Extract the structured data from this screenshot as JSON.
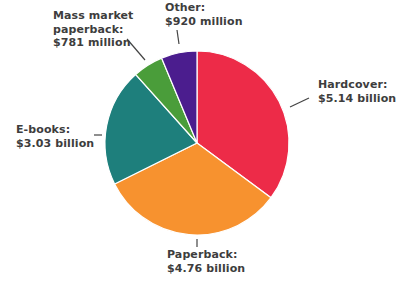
{
  "chart_data": {
    "type": "pie",
    "title": "",
    "center": [
      197,
      143
    ],
    "radius": 92,
    "start_angle_deg": 0,
    "direction": "clockwise",
    "slices": [
      {
        "name": "Hardcover",
        "value": 5.14,
        "display": "$5.14 billion",
        "color": "#ED2B48"
      },
      {
        "name": "Paperback",
        "value": 4.76,
        "display": "$4.76 billion",
        "color": "#F7922F"
      },
      {
        "name": "E-books",
        "value": 3.03,
        "display": "$3.03 billion",
        "color": "#1E7F7C"
      },
      {
        "name": "Mass market paperback",
        "value": 0.781,
        "display": "$781 million",
        "color": "#4A9D3A"
      },
      {
        "name": "Other",
        "value": 0.92,
        "display": "$920 million",
        "color": "#4B1D8E"
      }
    ],
    "units": "USD billions"
  },
  "labels": {
    "hardcover": {
      "line1": "Hardcover:",
      "line2": "$5.14 billion"
    },
    "paperback": {
      "line1": "Paperback:",
      "line2": "$4.76 billion"
    },
    "ebooks": {
      "line1": "E-books:",
      "line2": "$3.03 billion"
    },
    "mass_market": {
      "line1": "Mass market",
      "line2": "paperback:",
      "line3": "$781 million"
    },
    "other": {
      "line1": "Other:",
      "line2": "$920 million"
    }
  }
}
